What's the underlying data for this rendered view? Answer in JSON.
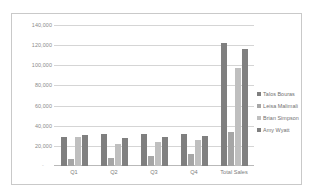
{
  "chart_data": {
    "type": "bar",
    "title": "",
    "xlabel": "",
    "ylabel": "",
    "categories": [
      "Q1",
      "Q2",
      "Q3",
      "Q4",
      "Total Sales"
    ],
    "series": [
      {
        "name": "Talos Bouras",
        "color": "#7f7f7f",
        "values": [
          28500,
          31500,
          32000,
          31500,
          122500
        ]
      },
      {
        "name": "Leisa Malimali",
        "color": "#a6a6a6",
        "values": [
          7000,
          8000,
          10000,
          11500,
          33500
        ]
      },
      {
        "name": "Brian Simpson",
        "color": "#bfbfbf",
        "values": [
          28500,
          22000,
          23500,
          26000,
          97000
        ]
      },
      {
        "name": "Amy Wyatt",
        "color": "#808080",
        "values": [
          31000,
          28000,
          29000,
          29500,
          116000
        ]
      }
    ],
    "ylim": [
      0,
      140000
    ],
    "ytick_values": [
      140000,
      120000,
      100000,
      80000,
      60000,
      40000,
      20000
    ],
    "ytick_labels": [
      "140,000",
      "120,000",
      "100,000",
      "80,000",
      "60,000",
      "40,000",
      "20,000"
    ],
    "zero_label": "-",
    "grid": true,
    "legend_position": "right",
    "legend_marker": "square",
    "colors": {
      "gridline": "#d5d5d5",
      "axis": "#b9b9b9",
      "tick_text": "#8a8a8a",
      "legend_text": "#6f6f6f",
      "frame_border": "#c9c9c9",
      "background": "#ffffff"
    }
  }
}
